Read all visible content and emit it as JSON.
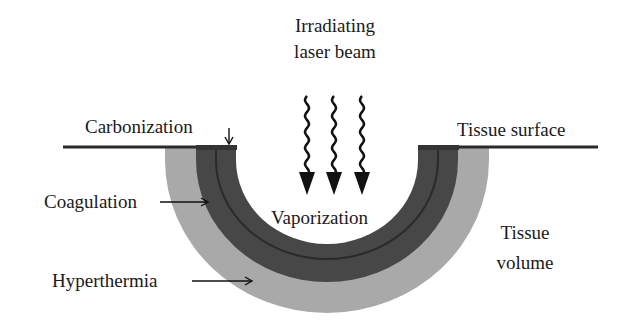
{
  "diagram": {
    "title_lines": [
      "Irradiating",
      "laser beam"
    ],
    "labels": {
      "carbonization": "Carbonization",
      "tissue_surface": "Tissue surface",
      "vaporization": "Vaporization",
      "coagulation": "Coagulation",
      "hyperthermia": "Hyperthermia",
      "tissue_volume_line1": "Tissue",
      "tissue_volume_line2": "volume"
    },
    "layers": [
      {
        "name": "Hyperthermia",
        "color": "#a9a9a9"
      },
      {
        "name": "Coagulation",
        "color": "#474747"
      },
      {
        "name": "Carbonization",
        "color": "#2e2e2e"
      },
      {
        "name": "Vaporization",
        "color": "#ffffff"
      }
    ],
    "beam_arrow_count": 3,
    "colors": {
      "surface_line": "#2a2a2a",
      "text": "#1a1a1a",
      "background": "#ffffff"
    }
  }
}
